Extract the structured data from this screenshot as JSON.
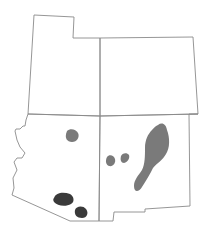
{
  "map": {
    "regions": [
      "Utah",
      "Colorado",
      "Arizona",
      "New Mexico"
    ],
    "colors": {
      "border": "#8a8a8a",
      "range_light": "#7a7a7a",
      "range_dark": "#3a3a3a",
      "background": "#ffffff"
    },
    "legend": []
  }
}
